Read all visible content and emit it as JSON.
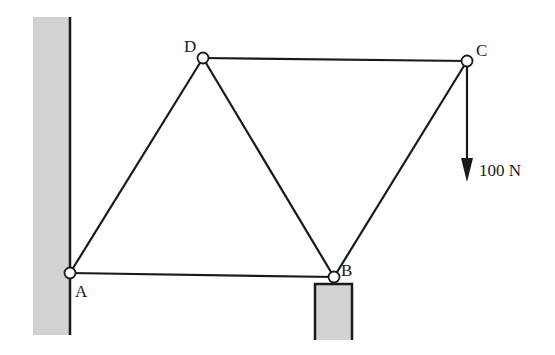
{
  "diagram": {
    "type": "truss",
    "nodes": {
      "A": {
        "label": "A",
        "x": 70,
        "y": 273
      },
      "B": {
        "label": "B",
        "x": 334,
        "y": 277
      },
      "C": {
        "label": "C",
        "x": 467,
        "y": 61
      },
      "D": {
        "label": "D",
        "x": 203,
        "y": 58
      }
    },
    "members": [
      [
        "A",
        "B"
      ],
      [
        "A",
        "D"
      ],
      [
        "D",
        "B"
      ],
      [
        "D",
        "C"
      ],
      [
        "B",
        "C"
      ]
    ],
    "load": {
      "node": "C",
      "direction": "down",
      "label": "100 N"
    },
    "supports": {
      "wall": "left wall at A",
      "block": "support block under B"
    },
    "colors": {
      "line": "#1a1a1a",
      "hatch": "#d2d2d2",
      "background": "#ffffff"
    }
  }
}
